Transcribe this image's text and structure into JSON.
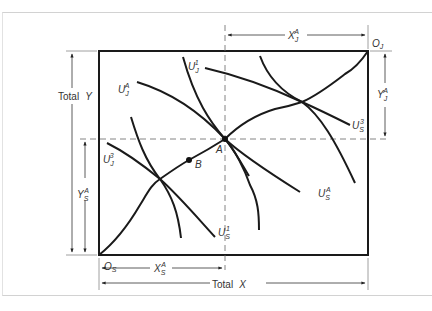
{
  "diagram": {
    "type": "edgeworth-box",
    "origins": {
      "s": {
        "label": "O",
        "sub": "S"
      },
      "j": {
        "label": "O",
        "sub": "J"
      }
    },
    "axes": {
      "total_x": {
        "word": "Total",
        "var": "X"
      },
      "total_y": {
        "word": "Total",
        "var": "Y"
      }
    },
    "dimension_labels": {
      "xja": {
        "var": "X",
        "sub": "J",
        "sup": "A"
      },
      "yja": {
        "var": "Y",
        "sub": "J",
        "sup": "A"
      },
      "ysa": {
        "var": "Y",
        "sub": "S",
        "sup": "A"
      },
      "xsa": {
        "var": "X",
        "sub": "S",
        "sup": "A"
      }
    },
    "points": [
      {
        "id": "A",
        "label": "A"
      },
      {
        "id": "B",
        "label": "B"
      }
    ],
    "curves": {
      "uj1": {
        "var": "U",
        "sub": "J",
        "sup": "1"
      },
      "uja": {
        "var": "U",
        "sub": "J",
        "sup": "A"
      },
      "uj3": {
        "var": "U",
        "sub": "J",
        "sup": "3"
      },
      "us1": {
        "var": "U",
        "sub": "S",
        "sup": "1"
      },
      "usa": {
        "var": "U",
        "sub": "S",
        "sup": "A"
      },
      "us3": {
        "var": "U",
        "sub": "S",
        "sup": "3"
      }
    },
    "colors": {
      "line": "#1a1a1a",
      "guide": "#555555",
      "frame": "#d2d2d2"
    }
  }
}
